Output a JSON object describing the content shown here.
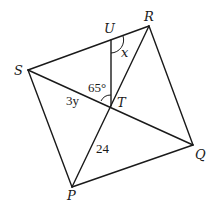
{
  "diagram": {
    "points": {
      "S": {
        "label": "S",
        "x": 28,
        "y": 70
      },
      "U": {
        "label": "U",
        "x": 111,
        "y": 40
      },
      "R": {
        "label": "R",
        "x": 149,
        "y": 26
      },
      "T": {
        "label": "T",
        "x": 111,
        "y": 106
      },
      "Q": {
        "label": "Q",
        "x": 193,
        "y": 145
      },
      "P": {
        "label": "P",
        "x": 72,
        "y": 187
      }
    },
    "segments": [
      "SR",
      "RQ",
      "QP",
      "PS",
      "SQ",
      "PR",
      "UT"
    ],
    "annotations": {
      "angle_x": "x",
      "angle_65": "65°",
      "length_ST": "3y",
      "length_PT": "24"
    }
  }
}
